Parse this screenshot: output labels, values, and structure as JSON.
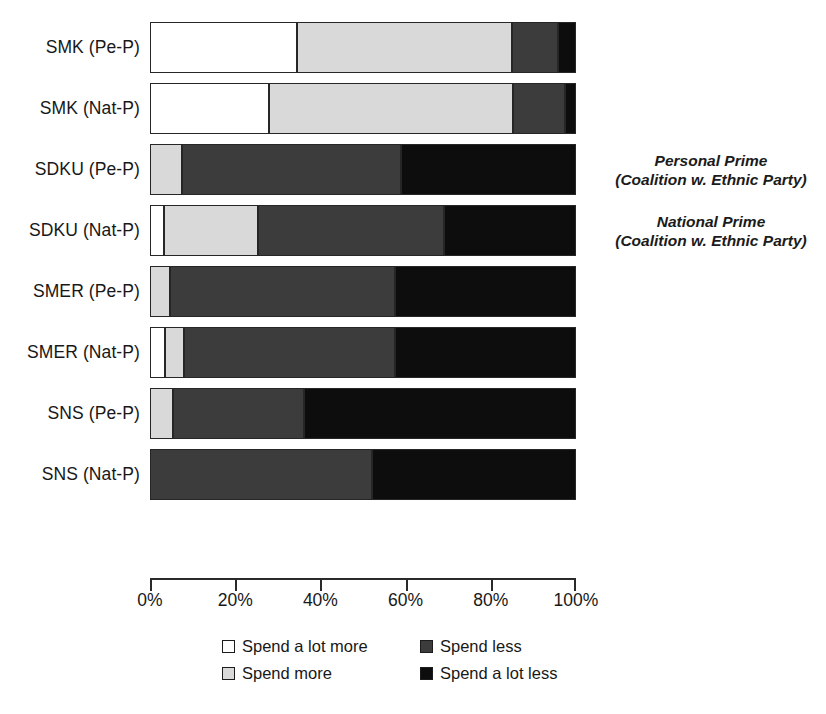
{
  "chart_data": {
    "type": "bar",
    "orientation": "horizontal",
    "stacked": true,
    "title": "",
    "xlabel": "",
    "ylabel": "",
    "xlim": [
      0,
      100
    ],
    "x_ticks": [
      "0%",
      "20%",
      "40%",
      "60%",
      "80%",
      "100%"
    ],
    "x_tick_values": [
      0,
      20,
      40,
      60,
      80,
      100
    ],
    "grid": false,
    "legend_position": "bottom",
    "categories": [
      "SMK (Pe-P)",
      "SMK (Nat-P)",
      "SDKU (Pe-P)",
      "SDKU (Nat-P)",
      "SMER (Pe-P)",
      "SMER (Nat-P)",
      "SNS (Pe-P)",
      "SNS (Nat-P)"
    ],
    "series": [
      {
        "name": "Spend a lot more",
        "color": "#ffffff",
        "values": [
          34.5,
          28.0,
          0.0,
          3.3,
          0.0,
          3.5,
          0.0,
          0.0
        ]
      },
      {
        "name": "Spend more",
        "color": "#d9d9d9",
        "values": [
          50.5,
          57.3,
          7.5,
          22.0,
          4.7,
          4.5,
          5.4,
          0.0
        ]
      },
      {
        "name": "Spend less",
        "color": "#3c3c3c",
        "values": [
          10.7,
          12.1,
          51.5,
          43.7,
          52.8,
          49.5,
          30.7,
          52.0
        ]
      },
      {
        "name": "Spend a lot less",
        "color": "#0d0d0d",
        "values": [
          4.3,
          2.6,
          41.0,
          31.0,
          42.5,
          42.5,
          63.9,
          48.0
        ]
      }
    ],
    "annotations": [
      {
        "target_category": "SDKU (Pe-P)",
        "lines": [
          "Personal Prime",
          "(Coalition w. Ethnic Party)"
        ]
      },
      {
        "target_category": "SDKU (Nat-P)",
        "lines": [
          "National Prime",
          "(Coalition w. Ethnic Party)"
        ]
      }
    ]
  },
  "legend": {
    "items": [
      {
        "label": "Spend a lot more",
        "color": "#ffffff"
      },
      {
        "label": "Spend more",
        "color": "#d9d9d9"
      },
      {
        "label": "Spend less",
        "color": "#3c3c3c"
      },
      {
        "label": "Spend a lot less",
        "color": "#0d0d0d"
      }
    ]
  },
  "axis": {
    "tick_labels": [
      "0%",
      "20%",
      "40%",
      "60%",
      "80%",
      "100%"
    ]
  },
  "scan_marks": ""
}
